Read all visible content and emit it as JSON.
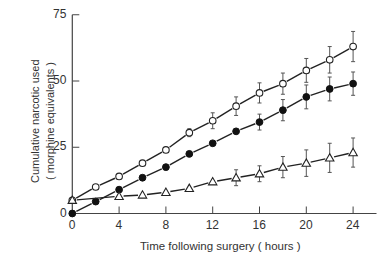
{
  "chart_data": {
    "type": "line",
    "title": "",
    "xlabel": "Time following surgery ( hours )",
    "ylabel_line1": "Cumulative narcotic used",
    "ylabel_line2": "( morphine equivalents )",
    "xlim": [
      0,
      26
    ],
    "ylim": [
      0,
      75
    ],
    "xticks": [
      0,
      4,
      8,
      12,
      16,
      20,
      24
    ],
    "yticks": [
      0,
      25,
      50,
      75
    ],
    "grid": false,
    "legend": null,
    "series": [
      {
        "name": "open-circle",
        "marker": "circle-open",
        "x": [
          0,
          2,
          4,
          6,
          8,
          10,
          12,
          14,
          16,
          18,
          20,
          22,
          24
        ],
        "y": [
          5,
          10,
          14,
          19,
          24,
          30.5,
          35,
          40.5,
          45.5,
          49,
          54,
          58,
          63
        ],
        "error": [
          0,
          0,
          0,
          0,
          0,
          1.5,
          3,
          3.5,
          3.8,
          4,
          4.5,
          5,
          5.7
        ]
      },
      {
        "name": "filled-circle",
        "marker": "circle-filled",
        "x": [
          0,
          2,
          4,
          6,
          8,
          10,
          12,
          14,
          16,
          18,
          20,
          22,
          24
        ],
        "y": [
          0,
          4.5,
          9,
          13.5,
          17.5,
          22.5,
          26.5,
          31,
          34.5,
          39,
          44,
          47,
          49
        ],
        "error": [
          0,
          0,
          0,
          0,
          0,
          0,
          0,
          0,
          3,
          4,
          4.5,
          4.5,
          4.4
        ]
      },
      {
        "name": "open-triangle",
        "marker": "triangle-open",
        "x": [
          0,
          4,
          6,
          8,
          10,
          12,
          14,
          16,
          18,
          20,
          22,
          24
        ],
        "y": [
          5,
          6.5,
          7,
          8,
          9.5,
          12,
          13.5,
          15,
          17.5,
          19,
          21,
          23
        ],
        "error": [
          0,
          0,
          0,
          0,
          0,
          0,
          3,
          3,
          4,
          5,
          5.5,
          5.5
        ]
      }
    ]
  }
}
